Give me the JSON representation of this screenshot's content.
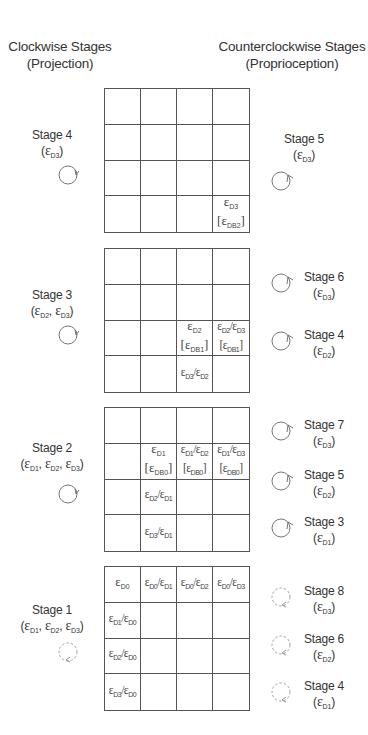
{
  "headers": {
    "left": {
      "title": "Clockwise Stages",
      "subtitle": "(Projection)"
    },
    "right": {
      "title": "Counterclockwise Stages",
      "subtitle": "(Proprioception)"
    }
  },
  "grids": [
    {
      "id": "grid-1",
      "cells": [
        "",
        "",
        "",
        "",
        "",
        "",
        "",
        "",
        "",
        "",
        "",
        "",
        "",
        "",
        "",
        "εD3 [εDB2]"
      ],
      "left_stage": {
        "label": "Stage 4",
        "params": "(εD3)",
        "icon": "clockwise-arrow-icon"
      },
      "right_stages": [
        {
          "label": "Stage 5",
          "params": "(εD3)",
          "icon": "counterclockwise-arrow-icon"
        }
      ]
    },
    {
      "id": "grid-2",
      "cells": [
        "",
        "",
        "",
        "",
        "",
        "",
        "",
        "",
        "",
        "",
        "εD2 [εDB1]",
        "εD2/εD3 [εDB1]",
        "",
        "",
        "εD3/εD2",
        ""
      ],
      "left_stage": {
        "label": "Stage 3",
        "params": "(εD2, εD3)",
        "icon": "clockwise-arrow-icon"
      },
      "right_stages": [
        {
          "label": "Stage 6",
          "params": "(εD3)",
          "icon": "counterclockwise-arrow-icon"
        },
        {
          "label": "Stage 4",
          "params": "(εD2)",
          "icon": "counterclockwise-arrow-icon"
        }
      ]
    },
    {
      "id": "grid-3",
      "cells": [
        "",
        "",
        "",
        "",
        "",
        "εD1 [εDB0]",
        "εD1/εD2 [εDB0]",
        "εD1/εD3 [εDB0]",
        "",
        "εD2/εD1",
        "",
        "",
        "",
        "εD3/εD1",
        "",
        ""
      ],
      "left_stage": {
        "label": "Stage 2",
        "params": "(εD1, εD2, εD3)",
        "icon": "clockwise-arrow-icon"
      },
      "right_stages": [
        {
          "label": "Stage 7",
          "params": "(εD3)",
          "icon": "counterclockwise-arrow-icon"
        },
        {
          "label": "Stage 5",
          "params": "(εD2)",
          "icon": "counterclockwise-arrow-icon"
        },
        {
          "label": "Stage 3",
          "params": "(εD1)",
          "icon": "counterclockwise-arrow-icon"
        }
      ]
    },
    {
      "id": "grid-4",
      "cells": [
        "εD0",
        "εD0/εD1",
        "εD0/εD2",
        "εD0/εD3",
        "εD1/εD0",
        "",
        "",
        "",
        "εD2/εD0",
        "",
        "",
        "",
        "εD3/εD0",
        "",
        "",
        ""
      ],
      "left_stage": {
        "label": "Stage 1",
        "params": "(εD1, εD2, εD3)",
        "icon": "dashed-clockwise-arrow-icon"
      },
      "right_stages": [
        {
          "label": "Stage 8",
          "params": "(εD3)",
          "icon": "dashed-counterclockwise-arrow-icon"
        },
        {
          "label": "Stage 6",
          "params": "(εD2)",
          "icon": "dashed-counterclockwise-arrow-icon"
        },
        {
          "label": "Stage 4",
          "params": "(εD1)",
          "icon": "dashed-counterclockwise-arrow-icon"
        }
      ]
    }
  ],
  "colors": {
    "line": "#555555",
    "text": "#333333",
    "dashed": "#888888"
  }
}
